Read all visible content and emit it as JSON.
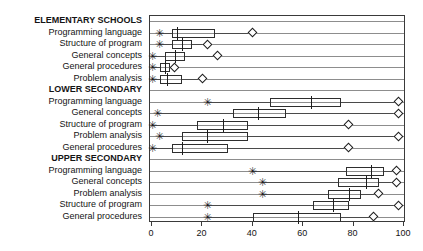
{
  "chart_data": {
    "type": "boxplot",
    "title": "",
    "xlabel": "",
    "ylabel": "",
    "xlim": [
      0,
      100
    ],
    "xticks": [
      0,
      20,
      40,
      60,
      80,
      100
    ],
    "xtick_labels": [
      "0",
      "20",
      "40",
      "60",
      "80",
      "100"
    ],
    "grid": true,
    "legend": null,
    "orientation": "horizontal",
    "groups": [
      {
        "name": "ELEMENTARY SCHOOLS",
        "rows": [
          {
            "label": "Programming language",
            "min": 3,
            "q1": 8,
            "median": 10,
            "q3": 25,
            "max": 40,
            "low_outlier": 3,
            "high_outlier": 40
          },
          {
            "label": "Structure of program",
            "min": 3,
            "q1": 8,
            "median": 12,
            "q3": 16,
            "max": 22,
            "low_outlier": 3,
            "high_outlier": 22
          },
          {
            "label": "General concepts",
            "min": 0,
            "q1": 5,
            "median": 9,
            "q3": 13,
            "max": 26,
            "low_outlier": 0,
            "high_outlier": 26
          },
          {
            "label": "General procedures",
            "min": 0,
            "q1": 3,
            "median": 5,
            "q3": 7,
            "max": 9,
            "low_outlier": 0,
            "high_outlier": 9
          },
          {
            "label": "Problem analysis",
            "min": 0,
            "q1": 3,
            "median": 6,
            "q3": 12,
            "max": 20,
            "low_outlier": 0,
            "high_outlier": 20
          }
        ]
      },
      {
        "name": "LOWER SECONDARY",
        "rows": [
          {
            "label": "Programming language",
            "min": 22,
            "q1": 47,
            "median": 63,
            "q3": 75,
            "max": 98,
            "low_outlier": 22,
            "high_outlier": 98
          },
          {
            "label": "General concepts",
            "min": 2,
            "q1": 32,
            "median": 42,
            "q3": 53,
            "max": 98,
            "low_outlier": 2,
            "high_outlier": 98
          },
          {
            "label": "Structure of program",
            "min": 0,
            "q1": 18,
            "median": 28,
            "q3": 38,
            "max": 78,
            "low_outlier": 0,
            "high_outlier": 78
          },
          {
            "label": "Problem analysis",
            "min": 3,
            "q1": 12,
            "median": 22,
            "q3": 38,
            "max": 98,
            "low_outlier": 3,
            "high_outlier": 98
          },
          {
            "label": "General procedures",
            "min": 0,
            "q1": 8,
            "median": 12,
            "q3": 30,
            "max": 78,
            "low_outlier": 0,
            "high_outlier": 78
          }
        ]
      },
      {
        "name": "UPPER SECONDARY",
        "rows": [
          {
            "label": "Programming language",
            "min": 40,
            "q1": 77,
            "median": 87,
            "q3": 92,
            "max": 97,
            "low_outlier": 40,
            "high_outlier": 97
          },
          {
            "label": "General concepts",
            "min": 44,
            "q1": 74,
            "median": 85,
            "q3": 90,
            "max": 97,
            "low_outlier": 44,
            "high_outlier": 97
          },
          {
            "label": "Problem analysis",
            "min": 44,
            "q1": 70,
            "median": 78,
            "q3": 83,
            "max": 90,
            "low_outlier": 44,
            "high_outlier": 90
          },
          {
            "label": "Structure of program",
            "min": 22,
            "q1": 64,
            "median": 72,
            "q3": 78,
            "max": 98,
            "low_outlier": 22,
            "high_outlier": 98
          },
          {
            "label": "General procedures",
            "min": 22,
            "q1": 40,
            "median": 58,
            "q3": 75,
            "max": 88,
            "low_outlier": 22,
            "high_outlier": 88
          }
        ]
      }
    ]
  },
  "style": {
    "box_color": "#2e2e2e",
    "grid_color": "#8d8d8d",
    "frame_color": "#3a3a3a",
    "text_color": "#141414",
    "background": "#ffffff"
  }
}
